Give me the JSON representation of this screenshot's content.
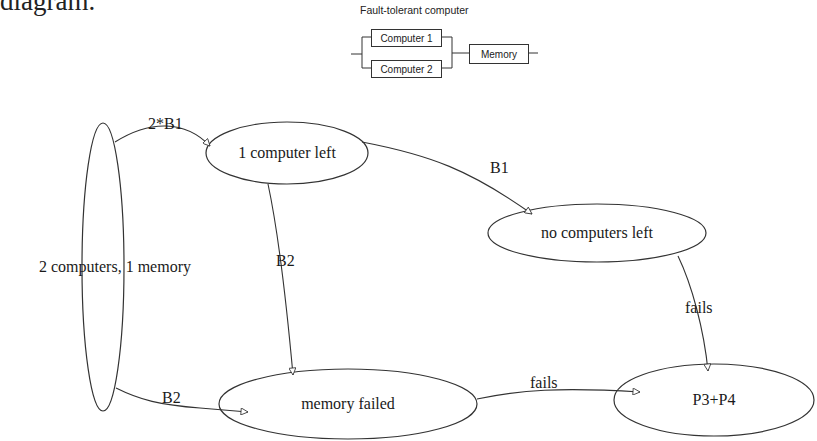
{
  "page": {
    "top_text_fragment": "diagram."
  },
  "block_diagram": {
    "title": "Fault-tolerant computer",
    "blocks": [
      {
        "label": "Computer 1"
      },
      {
        "label": "Computer 2"
      },
      {
        "label": "Memory"
      }
    ]
  },
  "state_diagram": {
    "nodes": [
      {
        "id": "s0",
        "label": "2 computers, 1 memory"
      },
      {
        "id": "s1",
        "label": "1 computer left"
      },
      {
        "id": "s2",
        "label": "no computers left"
      },
      {
        "id": "s3",
        "label": "memory failed"
      },
      {
        "id": "s4",
        "label": "P3+P4"
      }
    ],
    "edges": [
      {
        "from": "s0",
        "to": "s1",
        "label": "2*B1"
      },
      {
        "from": "s1",
        "to": "s2",
        "label": "B1"
      },
      {
        "from": "s1",
        "to": "s3",
        "label": "B2"
      },
      {
        "from": "s0",
        "to": "s3",
        "label": "B2"
      },
      {
        "from": "s2",
        "to": "s4",
        "label": "fails"
      },
      {
        "from": "s3",
        "to": "s4",
        "label": "fails"
      }
    ]
  }
}
